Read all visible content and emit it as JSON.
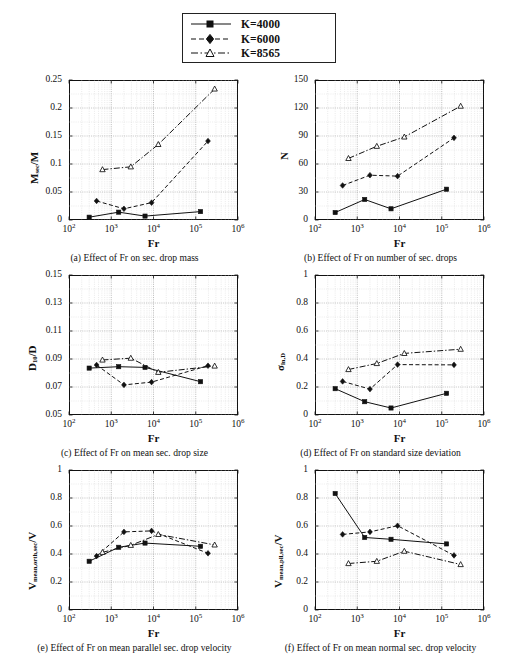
{
  "legend": {
    "entries": [
      {
        "label": "K=4000",
        "style": "solid",
        "marker": "square-filled",
        "color": "#111111"
      },
      {
        "label": "K=6000",
        "style": "dashed",
        "marker": "diamond-filled",
        "color": "#111111"
      },
      {
        "label": "K=8565",
        "style": "dashdot",
        "marker": "triangle-open",
        "color": "#111111"
      }
    ]
  },
  "chart_data": [
    {
      "id": "a",
      "type": "line",
      "title": "",
      "caption": "(a) Effect of Fr on sec. drop mass",
      "xlabel": "Fr",
      "ylabel": "M_sec/M",
      "xscale": "log",
      "xlim": [
        100,
        1000000
      ],
      "ylim": [
        0,
        0.25
      ],
      "xticks": [
        100,
        1000,
        10000,
        100000,
        1000000
      ],
      "xticklabels": [
        "10^2",
        "10^3",
        "10^4",
        "10^5",
        "10^6"
      ],
      "yticks": [
        0,
        0.05,
        0.1,
        0.15,
        0.2,
        0.25
      ],
      "yticklabels": [
        "0",
        "0.05",
        "0.1",
        "0.15",
        "0.2",
        "0.25"
      ],
      "grid": true,
      "series": [
        {
          "name": "K=4000",
          "x": [
            300,
            1500,
            6300,
            130000
          ],
          "y": [
            0.005,
            0.014,
            0.007,
            0.015
          ]
        },
        {
          "name": "K=6000",
          "x": [
            450,
            2000,
            9000,
            195000
          ],
          "y": [
            0.034,
            0.02,
            0.031,
            0.141
          ]
        },
        {
          "name": "K=8565",
          "x": [
            620,
            2900,
            13000,
            280000
          ],
          "y": [
            0.09,
            0.095,
            0.135,
            0.234
          ]
        }
      ]
    },
    {
      "id": "b",
      "type": "line",
      "title": "",
      "caption": "(b) Effect of Fr on number of sec. drops",
      "xlabel": "Fr",
      "ylabel": "N",
      "xscale": "log",
      "xlim": [
        100,
        1000000
      ],
      "ylim": [
        0,
        150
      ],
      "xticks": [
        100,
        1000,
        10000,
        100000,
        1000000
      ],
      "xticklabels": [
        "10^2",
        "10^3",
        "10^4",
        "10^5",
        "10^6"
      ],
      "yticks": [
        0,
        30,
        60,
        90,
        120,
        150
      ],
      "yticklabels": [
        "0",
        "30",
        "60",
        "90",
        "120",
        "150"
      ],
      "grid": true,
      "series": [
        {
          "name": "K=4000",
          "x": [
            300,
            1500,
            6300,
            130000
          ],
          "y": [
            8,
            22,
            12,
            33
          ]
        },
        {
          "name": "K=6000",
          "x": [
            450,
            2000,
            9000,
            195000
          ],
          "y": [
            37,
            48,
            47,
            88
          ]
        },
        {
          "name": "K=8565",
          "x": [
            620,
            2900,
            13000,
            280000
          ],
          "y": [
            66,
            79,
            89,
            122
          ]
        }
      ]
    },
    {
      "id": "c",
      "type": "line",
      "title": "",
      "caption": "(c) Effect of Fr on mean sec. drop size",
      "xlabel": "Fr",
      "ylabel": "D_10/D",
      "xscale": "log",
      "xlim": [
        100,
        1000000
      ],
      "ylim": [
        0.05,
        0.15
      ],
      "xticks": [
        100,
        1000,
        10000,
        100000,
        1000000
      ],
      "xticklabels": [
        "10^2",
        "10^3",
        "10^4",
        "10^5",
        "10^6"
      ],
      "yticks": [
        0.05,
        0.07,
        0.09,
        0.11,
        0.13,
        0.15
      ],
      "yticklabels": [
        "0.05",
        "0.07",
        "0.09",
        "0.11",
        "0.13",
        "0.15"
      ],
      "grid": true,
      "series": [
        {
          "name": "K=4000",
          "x": [
            300,
            1500,
            6300,
            130000
          ],
          "y": [
            0.0835,
            0.0845,
            0.084,
            0.0738
          ]
        },
        {
          "name": "K=6000",
          "x": [
            450,
            2000,
            9000,
            195000
          ],
          "y": [
            0.0857,
            0.0715,
            0.0735,
            0.0852
          ]
        },
        {
          "name": "K=8565",
          "x": [
            620,
            2900,
            13000,
            280000
          ],
          "y": [
            0.0893,
            0.0906,
            0.0805,
            0.085
          ]
        }
      ]
    },
    {
      "id": "d",
      "type": "line",
      "title": "",
      "caption": "(d) Effect of Fr on standard size deviation",
      "xlabel": "Fr",
      "ylabel": "sigma_ln,D",
      "xscale": "log",
      "xlim": [
        100,
        1000000
      ],
      "ylim": [
        0,
        1
      ],
      "xticks": [
        100,
        1000,
        10000,
        100000,
        1000000
      ],
      "xticklabels": [
        "10^2",
        "10^3",
        "10^4",
        "10^5",
        "10^6"
      ],
      "yticks": [
        0,
        0.2,
        0.4,
        0.6,
        0.8,
        1
      ],
      "yticklabels": [
        "0",
        "0.2",
        "0.4",
        "0.6",
        "0.8",
        "1"
      ],
      "grid": true,
      "series": [
        {
          "name": "K=4000",
          "x": [
            300,
            1500,
            6300,
            130000
          ],
          "y": [
            0.188,
            0.095,
            0.05,
            0.155
          ]
        },
        {
          "name": "K=6000",
          "x": [
            450,
            2000,
            9000,
            195000
          ],
          "y": [
            0.24,
            0.185,
            0.36,
            0.358
          ]
        },
        {
          "name": "K=8565",
          "x": [
            620,
            2900,
            13000,
            280000
          ],
          "y": [
            0.325,
            0.368,
            0.44,
            0.47
          ]
        }
      ]
    },
    {
      "id": "e",
      "type": "line",
      "title": "",
      "caption": "(e) Effect of Fr on mean parallel sec. drop velocity",
      "xlabel": "Fr",
      "ylabel": "V_mean,orth,sec/V",
      "xscale": "log",
      "xlim": [
        100,
        1000000
      ],
      "ylim": [
        0,
        1
      ],
      "xticks": [
        100,
        1000,
        10000,
        100000,
        1000000
      ],
      "xticklabels": [
        "10^2",
        "10^3",
        "10^4",
        "10^5",
        "10^6"
      ],
      "yticks": [
        0,
        0.2,
        0.4,
        0.6,
        0.8,
        1
      ],
      "yticklabels": [
        "0",
        "0.2",
        "0.4",
        "0.6",
        "0.8",
        "1"
      ],
      "grid": true,
      "series": [
        {
          "name": "K=4000",
          "x": [
            300,
            1500,
            6300,
            130000
          ],
          "y": [
            0.348,
            0.448,
            0.478,
            0.455
          ]
        },
        {
          "name": "K=6000",
          "x": [
            450,
            2000,
            9000,
            195000
          ],
          "y": [
            0.385,
            0.558,
            0.565,
            0.405
          ]
        },
        {
          "name": "K=8565",
          "x": [
            620,
            2900,
            13000,
            280000
          ],
          "y": [
            0.412,
            0.462,
            0.54,
            0.465
          ]
        }
      ]
    },
    {
      "id": "f",
      "type": "line",
      "title": "",
      "caption": "(f) Effect of Fr on mean normal sec. drop velocity",
      "xlabel": "Fr",
      "ylabel": "V_mean,pll,sec/V",
      "xscale": "log",
      "xlim": [
        100,
        1000000
      ],
      "ylim": [
        0,
        1
      ],
      "xticks": [
        100,
        1000,
        10000,
        100000,
        1000000
      ],
      "xticklabels": [
        "10^2",
        "10^3",
        "10^4",
        "10^5",
        "10^6"
      ],
      "yticks": [
        0,
        0.2,
        0.4,
        0.6,
        0.8,
        1
      ],
      "yticklabels": [
        "0",
        "0.2",
        "0.4",
        "0.6",
        "0.8",
        "1"
      ],
      "grid": true,
      "series": [
        {
          "name": "K=4000",
          "x": [
            300,
            1500,
            6300,
            130000
          ],
          "y": [
            0.832,
            0.518,
            0.505,
            0.472
          ]
        },
        {
          "name": "K=6000",
          "x": [
            450,
            2000,
            9000,
            195000
          ],
          "y": [
            0.54,
            0.558,
            0.602,
            0.39
          ]
        },
        {
          "name": "K=8565",
          "x": [
            620,
            2900,
            13000,
            280000
          ],
          "y": [
            0.332,
            0.348,
            0.42,
            0.325
          ]
        }
      ]
    }
  ]
}
